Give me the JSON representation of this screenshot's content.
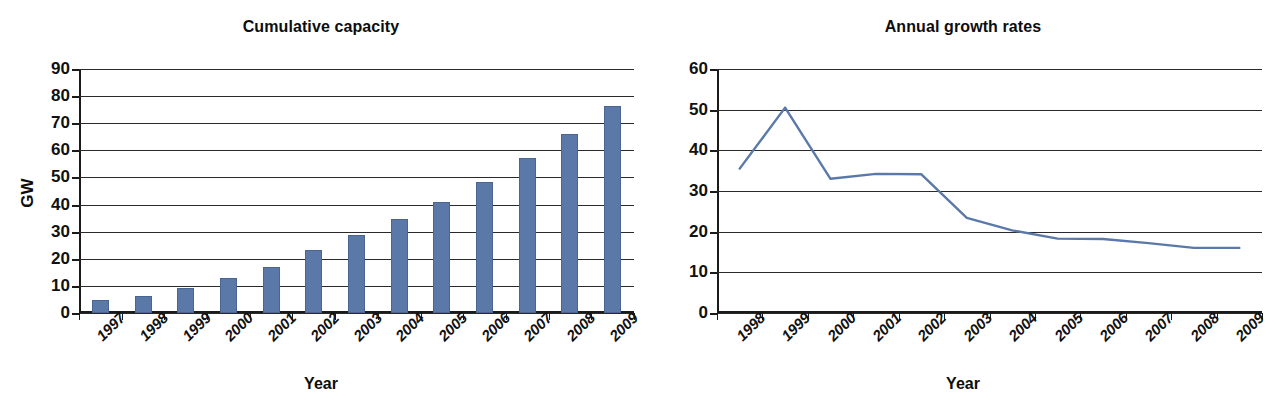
{
  "figure": {
    "width": 1284,
    "height": 416,
    "background": "#ffffff",
    "series_color": "#5b79a8",
    "axis_color": "#1a1a1a",
    "grid_color": "#2a2a2a"
  },
  "panels": [
    {
      "id": "cumulative-capacity",
      "title": "Cumulative capacity",
      "xlabel": "Year",
      "ylabel": "GW"
    },
    {
      "id": "annual-growth-rates",
      "title": "Annual growth rates",
      "xlabel": "Year",
      "ylabel": "%"
    }
  ],
  "chart_data": [
    {
      "type": "bar",
      "title": "Cumulative capacity",
      "xlabel": "Year",
      "ylabel": "GW",
      "categories": [
        "1997",
        "1998",
        "1999",
        "2000",
        "2001",
        "2002",
        "2003",
        "2004",
        "2005",
        "2006",
        "2007",
        "2008",
        "2009"
      ],
      "values": [
        4.8,
        6.1,
        9.4,
        12.8,
        17.1,
        23.3,
        28.6,
        34.8,
        40.9,
        48.3,
        57.2,
        66.0,
        76.5
      ],
      "ylim": [
        0,
        90
      ],
      "yticks": [
        0,
        10,
        20,
        30,
        40,
        50,
        60,
        70,
        80,
        90
      ],
      "ytick_labels": [
        "0",
        "10",
        "20",
        "30",
        "40",
        "50",
        "60",
        "70",
        "80",
        "90"
      ],
      "grid": true,
      "legend": false,
      "bar_color": "#5b79a8"
    },
    {
      "type": "line",
      "title": "Annual growth rates",
      "xlabel": "Year",
      "ylabel": "%",
      "categories": [
        "1998",
        "1999",
        "2000",
        "2001",
        "2002",
        "2003",
        "2004",
        "2005",
        "2006",
        "2007",
        "2008",
        "2009"
      ],
      "values": [
        35.5,
        50.5,
        33.0,
        34.2,
        34.1,
        23.4,
        20.3,
        18.3,
        18.2,
        17.2,
        16.0,
        16.0
      ],
      "ylim": [
        0,
        60
      ],
      "yticks": [
        0,
        10,
        20,
        30,
        40,
        50,
        60
      ],
      "ytick_labels": [
        "0",
        "10",
        "20",
        "30",
        "40",
        "50",
        "60"
      ],
      "grid": true,
      "legend": false,
      "line_color": "#5b79a8"
    }
  ]
}
